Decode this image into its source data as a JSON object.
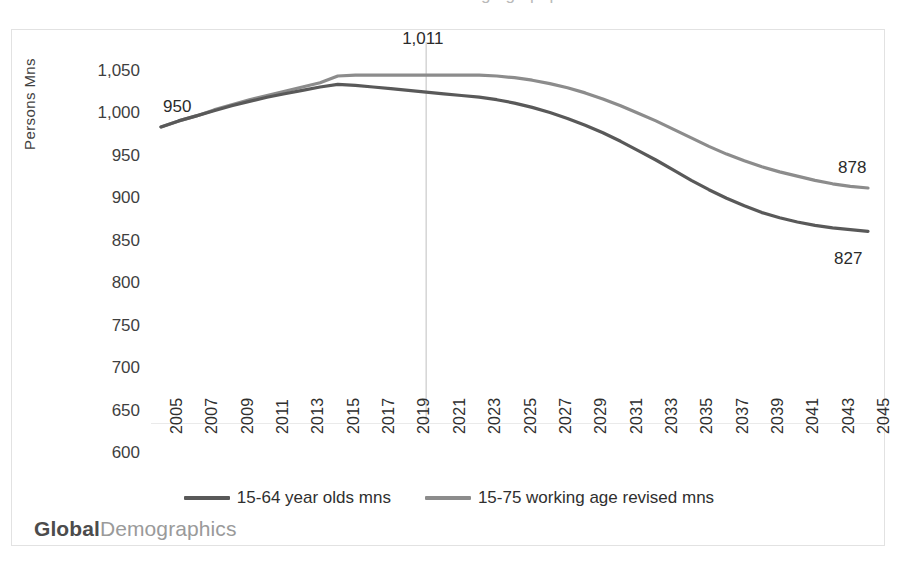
{
  "top_partial_title": "working age population",
  "brand": {
    "part1": "Global",
    "part2": "Demographics"
  },
  "axes": {
    "ylabel": "Persons Mns",
    "yticks": [
      "600",
      "650",
      "700",
      "750",
      "800",
      "850",
      "900",
      "950",
      "1,000",
      "1,050"
    ],
    "xticks": [
      "2005",
      "2007",
      "2009",
      "2011",
      "2013",
      "2015",
      "2017",
      "2019",
      "2021",
      "2023",
      "2025",
      "2027",
      "2029",
      "2031",
      "2033",
      "2035",
      "2037",
      "2039",
      "2041",
      "2043",
      "2045"
    ]
  },
  "legend": {
    "items": [
      {
        "label": "15-64 year olds mns",
        "color": "#595959"
      },
      {
        "label": "15-75 working age revised mns",
        "color": "#8c8c8c"
      }
    ]
  },
  "annotations": [
    {
      "name": "start-label",
      "text": "950"
    },
    {
      "name": "peak-label",
      "text": "1,011"
    },
    {
      "name": "end-label-upper",
      "text": "878"
    },
    {
      "name": "end-label-lower",
      "text": "827"
    }
  ],
  "chart_data": {
    "type": "line",
    "title": "working age population",
    "xlabel": "",
    "ylabel": "Persons Mns",
    "ylim": [
      600,
      1050
    ],
    "ytick_step": 50,
    "grid": false,
    "legend_position": "bottom",
    "annotations": [
      {
        "text": "950",
        "x": 2005,
        "y": 950,
        "series": "15-64 year olds mns"
      },
      {
        "text": "1,011",
        "x": 2020,
        "y": 1011,
        "series": "15-75 working age revised mns"
      },
      {
        "text": "878",
        "x": 2045,
        "y": 878,
        "series": "15-75 working age revised mns"
      },
      {
        "text": "827",
        "x": 2045,
        "y": 827,
        "series": "15-64 year olds mns"
      }
    ],
    "vertical_marker": {
      "x": 2020,
      "label": "1,011",
      "color": "#bfbfbf"
    },
    "x": [
      2005,
      2006,
      2007,
      2008,
      2009,
      2010,
      2011,
      2012,
      2013,
      2014,
      2015,
      2016,
      2017,
      2018,
      2019,
      2020,
      2021,
      2022,
      2023,
      2024,
      2025,
      2026,
      2027,
      2028,
      2029,
      2030,
      2031,
      2032,
      2033,
      2034,
      2035,
      2036,
      2037,
      2038,
      2039,
      2040,
      2041,
      2042,
      2043,
      2044,
      2045
    ],
    "series": [
      {
        "name": "15-64 year olds mns",
        "color": "#595959",
        "values": [
          950,
          957,
          963,
          969,
          975,
          980,
          985,
          989,
          993,
          997,
          1000,
          999,
          997,
          995,
          993,
          991,
          989,
          987,
          985,
          982,
          978,
          973,
          967,
          960,
          952,
          943,
          933,
          922,
          911,
          899,
          887,
          876,
          866,
          857,
          849,
          843,
          838,
          834,
          831,
          829,
          827
        ]
      },
      {
        "name": "15-75 working age revised mns",
        "color": "#8c8c8c",
        "values": [
          950,
          957,
          963,
          970,
          976,
          982,
          987,
          992,
          997,
          1002,
          1010,
          1011,
          1011,
          1011,
          1011,
          1011,
          1011,
          1011,
          1011,
          1010,
          1008,
          1005,
          1001,
          996,
          990,
          983,
          975,
          966,
          957,
          947,
          937,
          927,
          918,
          910,
          903,
          897,
          892,
          887,
          883,
          880,
          878
        ]
      }
    ]
  }
}
